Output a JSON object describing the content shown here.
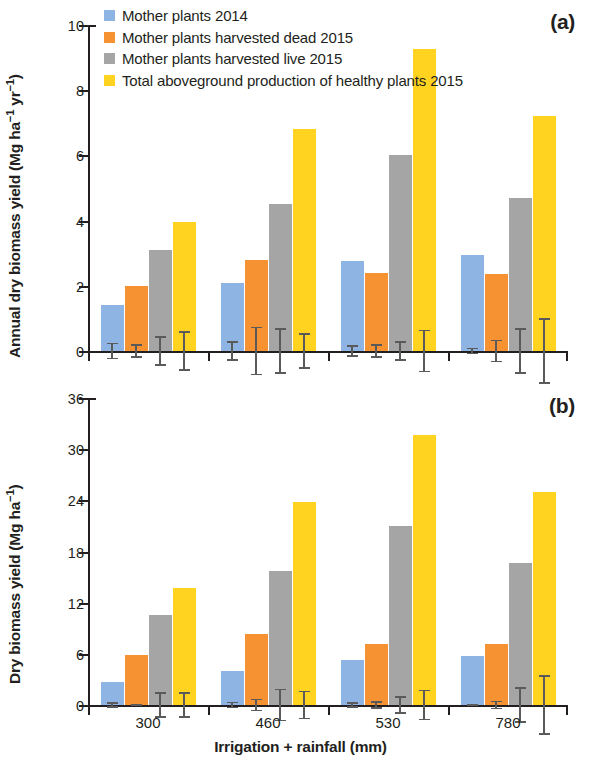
{
  "figure": {
    "xlabel": "Irrigation + rainfall (mm)",
    "categories": [
      "300",
      "460",
      "530",
      "780"
    ],
    "panel_a_label": "(a)",
    "panel_b_label": "(b)"
  },
  "legend": {
    "items": [
      {
        "label": "Mother plants 2014",
        "color": "#8EB4E3",
        "key": "mother_plants_2014"
      },
      {
        "label": "Mother plants harvested dead 2015",
        "color": "#F79233",
        "key": "harvested_dead_2015"
      },
      {
        "label": "Mother plants harvested live 2015",
        "color": "#A5A5A5",
        "key": "harvested_live_2015"
      },
      {
        "label": "Total aboveground production of healthy plants 2015",
        "color": "#FFD320",
        "key": "total_aboveground_2015"
      }
    ]
  },
  "axes": {
    "panel_a_ylabels": [
      "0",
      "2",
      "4",
      "6",
      "8",
      "10"
    ],
    "panel_b_ylabels": [
      "0",
      "6",
      "12",
      "18",
      "24",
      "30",
      "36"
    ],
    "panel_a_ytitle_main": "Annual dry biomass yield (Mg ha",
    "panel_a_ytitle_sup1": "−1",
    "panel_a_ytitle_mid": " yr",
    "panel_a_ytitle_sup2": "−1",
    "panel_a_ytitle_end": ")",
    "panel_b_ytitle_main": "Dry biomass yield (Mg ha",
    "panel_b_ytitle_sup1": "−1",
    "panel_b_ytitle_end": ")"
  },
  "chart_data": [
    {
      "type": "bar",
      "panel": "(a)",
      "title": "",
      "xlabel": "Irrigation + rainfall (mm)",
      "ylabel": "Annual dry biomass yield (Mg ha−1 yr−1)",
      "categories": [
        "300",
        "460",
        "530",
        "780"
      ],
      "ylim": [
        0,
        10
      ],
      "yticks": [
        0,
        2,
        4,
        6,
        8,
        10
      ],
      "grid": false,
      "legend_position": "top-left",
      "series": [
        {
          "name": "Mother plants 2014",
          "color": "#8EB4E3",
          "values": [
            1.4,
            2.1,
            2.75,
            2.95
          ],
          "errors": [
            0.25,
            0.3,
            0.17,
            0.1
          ]
        },
        {
          "name": "Mother plants harvested dead 2015",
          "color": "#F79233",
          "values": [
            2.0,
            2.8,
            2.4,
            2.35
          ],
          "errors": [
            0.2,
            0.75,
            0.2,
            0.35
          ]
        },
        {
          "name": "Mother plants harvested live 2015",
          "color": "#A5A5A5",
          "values": [
            3.1,
            4.5,
            6.0,
            4.7
          ],
          "errors": [
            0.45,
            0.7,
            0.3,
            0.7
          ]
        },
        {
          "name": "Total aboveground production of healthy plants 2015",
          "color": "#FFD320",
          "values": [
            3.95,
            6.8,
            9.25,
            7.2
          ],
          "errors": [
            0.6,
            0.55,
            0.65,
            1.0
          ]
        }
      ]
    },
    {
      "type": "bar",
      "panel": "(b)",
      "title": "",
      "xlabel": "Irrigation + rainfall (mm)",
      "ylabel": "Dry biomass yield (Mg ha−1)",
      "categories": [
        "300",
        "460",
        "530",
        "780"
      ],
      "ylim": [
        0,
        36
      ],
      "yticks": [
        0,
        6,
        12,
        18,
        24,
        30,
        36
      ],
      "grid": false,
      "legend_position": "none",
      "series": [
        {
          "name": "Mother plants 2014",
          "color": "#8EB4E3",
          "values": [
            2.7,
            4.0,
            5.3,
            5.7
          ],
          "errors": [
            0.35,
            0.4,
            0.3,
            0.15
          ]
        },
        {
          "name": "Mother plants harvested dead 2015",
          "color": "#F79233",
          "values": [
            5.9,
            8.3,
            7.2,
            7.1
          ],
          "errors": [
            0.15,
            0.75,
            0.45,
            0.5
          ]
        },
        {
          "name": "Mother plants harvested live 2015",
          "color": "#A5A5A5",
          "values": [
            10.6,
            15.7,
            21.0,
            16.6
          ],
          "errors": [
            1.5,
            1.9,
            1.0,
            2.1
          ]
        },
        {
          "name": "Total aboveground production of healthy plants 2015",
          "color": "#FFD320",
          "values": [
            13.7,
            23.8,
            31.7,
            25.0
          ],
          "errors": [
            1.5,
            1.7,
            1.8,
            3.5
          ]
        }
      ]
    }
  ]
}
